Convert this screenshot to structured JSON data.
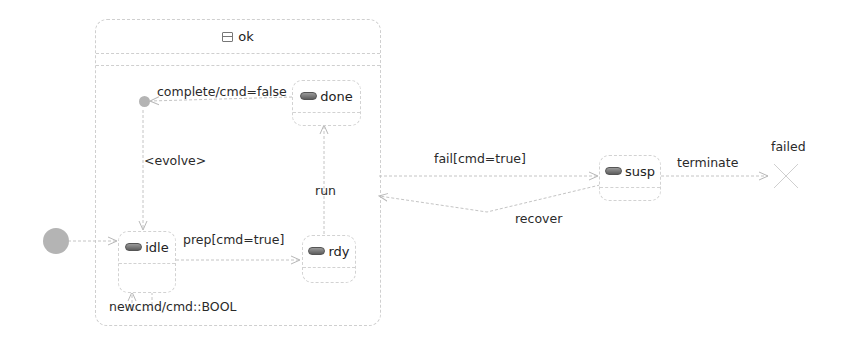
{
  "diagram": {
    "type": "uml-state-machine",
    "composite_state": {
      "name": "ok",
      "icon": "composite-state-icon",
      "substates": [
        {
          "id": "done",
          "label": "done",
          "icon": "simple-state-icon"
        },
        {
          "id": "idle",
          "label": "idle",
          "icon": "simple-state-icon"
        },
        {
          "id": "rdy",
          "label": "rdy",
          "icon": "simple-state-icon"
        }
      ]
    },
    "states": [
      {
        "id": "susp",
        "label": "susp",
        "icon": "simple-state-icon"
      }
    ],
    "final_states": [
      {
        "id": "failed",
        "label": "failed",
        "kind": "terminate"
      }
    ],
    "transitions": [
      {
        "from": "done",
        "to": "inner-initial",
        "label": "complete/cmd=false"
      },
      {
        "from": "inner-initial",
        "to": "idle",
        "label": "<evolve>"
      },
      {
        "from": "rdy",
        "to": "done",
        "label": "run"
      },
      {
        "from": "idle",
        "to": "rdy",
        "label": "prep[cmd=true]"
      },
      {
        "from": "idle",
        "to": "idle",
        "label": "newcmd/cmd::BOOL"
      },
      {
        "from": "outer-initial",
        "to": "idle",
        "label": ""
      },
      {
        "from": "ok",
        "to": "susp",
        "label": "fail[cmd=true]"
      },
      {
        "from": "susp",
        "to": "ok",
        "label": "recover"
      },
      {
        "from": "susp",
        "to": "failed",
        "label": "terminate"
      }
    ]
  }
}
